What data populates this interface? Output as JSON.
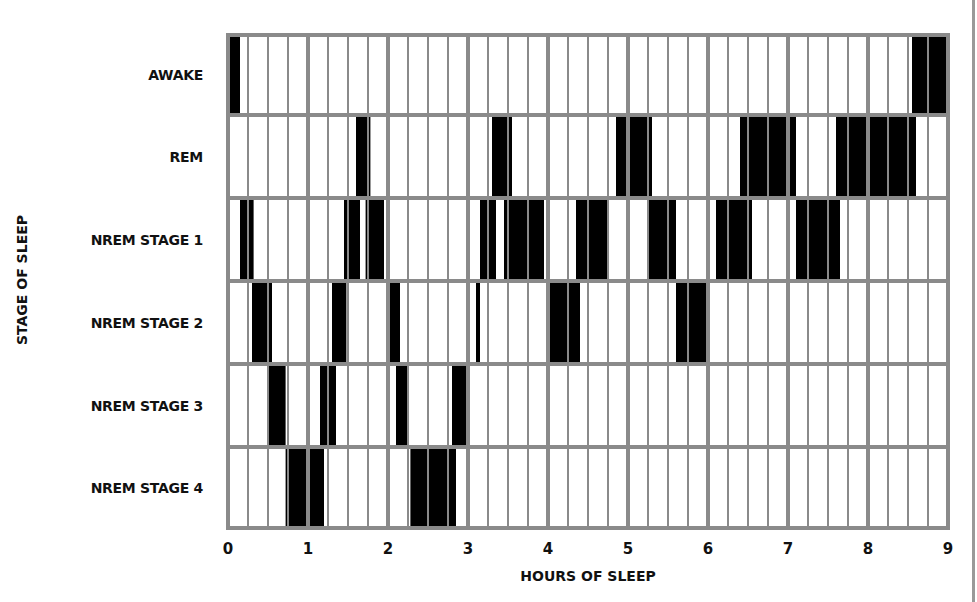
{
  "chart_data": {
    "type": "heatmap",
    "title": "",
    "xlabel": "HOURS OF SLEEP",
    "ylabel": "STAGE OF SLEEP",
    "xlim": [
      0,
      9
    ],
    "x_ticks": [
      "0",
      "1",
      "2",
      "3",
      "4",
      "5",
      "6",
      "7",
      "8",
      "9"
    ],
    "grid": {
      "major_step_hours": 1,
      "minor_step_hours": 0.25
    },
    "categories": [
      "AWAKE",
      "REM",
      "NREM STAGE 1",
      "NREM STAGE 2",
      "NREM STAGE 3",
      "NREM STAGE 4"
    ],
    "series": [
      {
        "name": "AWAKE",
        "intervals": [
          [
            0.0,
            0.15
          ],
          [
            8.55,
            9.0
          ]
        ]
      },
      {
        "name": "REM",
        "intervals": [
          [
            1.6,
            1.78
          ],
          [
            3.3,
            3.55
          ],
          [
            4.85,
            5.3
          ],
          [
            6.4,
            7.1
          ],
          [
            7.6,
            8.6
          ]
        ]
      },
      {
        "name": "NREM STAGE 1",
        "intervals": [
          [
            0.15,
            0.32
          ],
          [
            1.45,
            1.65
          ],
          [
            1.72,
            1.95
          ],
          [
            3.15,
            3.35
          ],
          [
            3.45,
            3.95
          ],
          [
            4.35,
            4.75
          ],
          [
            5.25,
            5.6
          ],
          [
            6.1,
            6.55
          ],
          [
            7.1,
            7.65
          ]
        ]
      },
      {
        "name": "NREM STAGE 2",
        "intervals": [
          [
            0.3,
            0.55
          ],
          [
            1.3,
            1.48
          ],
          [
            1.98,
            2.15
          ],
          [
            3.1,
            3.15
          ],
          [
            4.0,
            4.4
          ],
          [
            5.6,
            6.0
          ]
        ]
      },
      {
        "name": "NREM STAGE 3",
        "intervals": [
          [
            0.5,
            0.72
          ],
          [
            1.15,
            1.35
          ],
          [
            2.1,
            2.25
          ],
          [
            2.8,
            3.0
          ]
        ]
      },
      {
        "name": "NREM STAGE 4",
        "intervals": [
          [
            0.72,
            1.2
          ],
          [
            2.28,
            2.85
          ]
        ]
      }
    ],
    "colors": {
      "block": "#000000",
      "grid": "#8a8a8a",
      "background": "#ffffff"
    }
  }
}
